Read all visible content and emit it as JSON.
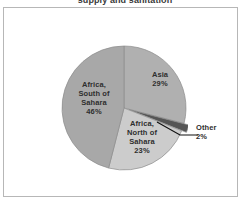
{
  "title_visible_text": "supply and sanitation",
  "frame": {
    "border_color": "#b7b7b7"
  },
  "labels": {
    "asia": "Asia\n29%",
    "africa_south": "Africa,\nSouth of\nSahara\n46%",
    "africa_north": "Africa,\nNorth of\nSahara\n23%",
    "other": "Other\n2%"
  },
  "chart_data": {
    "type": "pie",
    "title": "supply and sanitation",
    "subtitle": "",
    "xlabel": "",
    "ylabel": "",
    "grid": false,
    "legend": "none",
    "label_position": "inside-slice, with external callout for small slice",
    "start_angle_deg": 0,
    "direction": "clockwise",
    "units": "percent",
    "total": 100,
    "categories": [
      "Asia",
      "Other",
      "Africa, North of Sahara",
      "Africa, South of Sahara"
    ],
    "values": [
      29,
      2,
      23,
      46
    ],
    "slices": [
      {
        "name": "Asia",
        "value": 29,
        "label": "Asia",
        "value_label": "29%",
        "color": "#b0b0b0",
        "exploded": false,
        "callout": false,
        "start_deg": 0,
        "end_deg": 104.4
      },
      {
        "name": "Other",
        "value": 2,
        "label": "Other",
        "value_label": "2%",
        "color": "#555555",
        "exploded": true,
        "callout": true,
        "start_deg": 104.4,
        "end_deg": 111.6
      },
      {
        "name": "Africa, North of Sahara",
        "value": 23,
        "label": "Africa, North of Sahara",
        "value_label": "23%",
        "color": "#cccccc",
        "exploded": false,
        "callout": false,
        "start_deg": 111.6,
        "end_deg": 194.4
      },
      {
        "name": "Africa, South of Sahara",
        "value": 46,
        "label": "Africa, South of Sahara",
        "value_label": "46%",
        "color": "#a8a8a8",
        "exploded": false,
        "callout": false,
        "start_deg": 194.4,
        "end_deg": 360
      }
    ]
  }
}
